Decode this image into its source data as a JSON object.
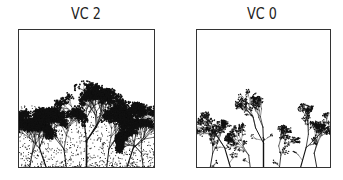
{
  "panels": [
    {
      "label": "VC 2",
      "style": "dense",
      "canopy_top_fraction": 0.62
    },
    {
      "label": "VC 0",
      "style": "sparse",
      "canopy_top_fraction": 0.58
    }
  ],
  "colors": {
    "ink": "#111111",
    "frame": "#333333",
    "background": "#ffffff"
  }
}
